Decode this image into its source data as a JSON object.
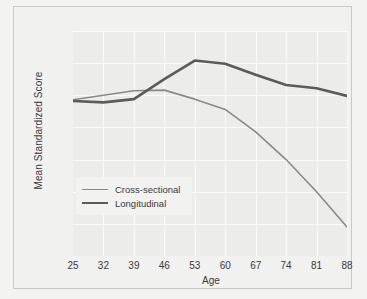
{
  "chart_data": {
    "type": "line",
    "title": "",
    "xlabel": "Age",
    "ylabel": "Mean Standardized Score",
    "x": [
      25,
      32,
      39,
      46,
      53,
      60,
      67,
      74,
      81,
      88
    ],
    "xtick_labels": [
      "25",
      "32",
      "39",
      "46",
      "53",
      "60",
      "67",
      "74",
      "81",
      "88"
    ],
    "ytick_labels": [
      "30",
      "35",
      "40",
      "45",
      "50",
      "55",
      "60",
      "65"
    ],
    "yticks": [
      30,
      35,
      40,
      45,
      50,
      55,
      60,
      65
    ],
    "xlim": [
      25,
      88
    ],
    "ylim": [
      30,
      65
    ],
    "grid": true,
    "legend_position": "inside-lower-left",
    "series": [
      {
        "name": "Cross-sectional",
        "color": "#8a8a8a",
        "width": 1.6,
        "values": [
          54.3,
          55.0,
          55.7,
          55.8,
          54.4,
          52.8,
          49.3,
          45.0,
          40.0,
          34.5
        ]
      },
      {
        "name": "Longitudinal",
        "color": "#5b5b5b",
        "width": 2.6,
        "values": [
          54.1,
          53.9,
          54.4,
          57.5,
          60.4,
          59.9,
          58.2,
          56.6,
          56.1,
          54.9
        ]
      }
    ]
  },
  "legend": {
    "items": [
      {
        "label": "Cross-sectional"
      },
      {
        "label": "Longitudinal"
      }
    ]
  },
  "axes": {
    "x_title": "Age",
    "y_title": "Mean Standardized Score"
  }
}
